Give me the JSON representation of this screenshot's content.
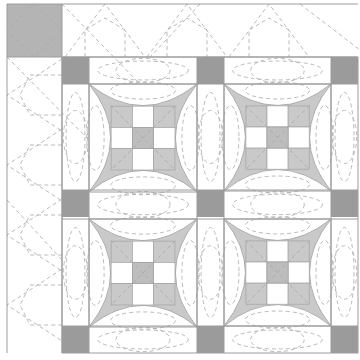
{
  "diagram": {
    "kind": "quilt-pattern",
    "colors": {
      "background": "#ffffff",
      "cornerstone": "#9b9b9b",
      "corner_block": "#b4b4b4",
      "fabric_fill": "#c9c9c9",
      "outline": "#9c9c9c",
      "quilting_line": "#a8a8a8"
    },
    "grid": {
      "columns_x": [
        62,
        89,
        197,
        224,
        331,
        358
      ],
      "rows_y": [
        57,
        84,
        190,
        219,
        326,
        353
      ],
      "border_left": 7,
      "border_top": 4
    },
    "corner_block": {
      "x": 7,
      "y": 4,
      "w": 55,
      "h": 53
    },
    "cornerstones": [
      {
        "x": 62,
        "y": 57
      },
      {
        "x": 197,
        "y": 57
      },
      {
        "x": 331,
        "y": 57
      },
      {
        "x": 62,
        "y": 190
      },
      {
        "x": 197,
        "y": 190
      },
      {
        "x": 331,
        "y": 190
      },
      {
        "x": 62,
        "y": 326
      },
      {
        "x": 197,
        "y": 326
      },
      {
        "x": 331,
        "y": 326
      }
    ],
    "blocks": [
      {
        "name": "block-top-left",
        "x": 89,
        "y": 84,
        "size": 108
      },
      {
        "name": "block-top-right",
        "x": 224,
        "y": 84,
        "size": 107
      },
      {
        "name": "block-bottom-left",
        "x": 89,
        "y": 219,
        "size": 108
      },
      {
        "name": "block-bottom-right",
        "x": 224,
        "y": 219,
        "size": 107
      }
    ],
    "block_style": "curved-pillow with nine-patch center"
  }
}
